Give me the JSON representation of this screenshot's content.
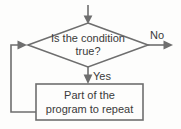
{
  "diagram": {
    "type": "flowchart",
    "background_color": "#fdfdfc",
    "stroke_color": "#6e6e6e",
    "text_color": "#3a3a3a",
    "nodes": [
      {
        "id": "decision",
        "shape": "diamond",
        "text_line1": "Is the condition",
        "text_line2": "true?"
      },
      {
        "id": "process",
        "shape": "rectangle",
        "text_line1": "Part of the",
        "text_line2": "program to repeat"
      }
    ],
    "edges": [
      {
        "id": "entry",
        "label": ""
      },
      {
        "id": "false-branch",
        "label": "No"
      },
      {
        "id": "true-branch",
        "label": "Yes"
      },
      {
        "id": "loop-back",
        "label": ""
      }
    ]
  }
}
